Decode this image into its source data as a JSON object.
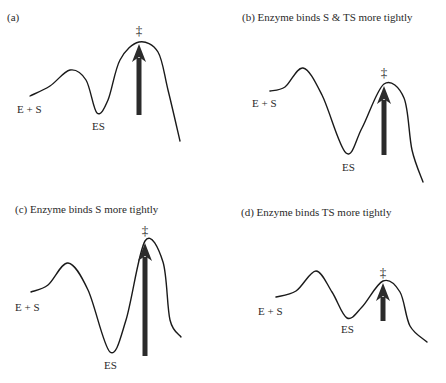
{
  "figure": {
    "panels": [
      {
        "id": "a",
        "title": "(a)",
        "title_pos": [
          7,
          21
        ],
        "curve": [
          [
            30,
            96
          ],
          [
            50,
            86
          ],
          [
            70,
            70
          ],
          [
            86,
            80
          ],
          [
            97,
            113
          ],
          [
            108,
            100
          ],
          [
            120,
            60
          ],
          [
            139,
            42
          ],
          [
            158,
            52
          ],
          [
            168,
            90
          ],
          [
            180,
            141
          ]
        ],
        "arrow": {
          "x": 139,
          "y_bottom": 115,
          "y_top": 44
        },
        "dagger": {
          "symbol": "‡",
          "x": 139,
          "y": 35
        },
        "label_es_plus": {
          "text": "E + S",
          "x": 17,
          "y": 113
        },
        "label_es": {
          "text": "ES",
          "x": 92,
          "y": 130
        }
      },
      {
        "id": "b",
        "title": "(b) Enzyme binds S & TS more tightly",
        "title_pos": [
          242,
          21
        ],
        "curve": [
          [
            270,
            91
          ],
          [
            285,
            87
          ],
          [
            303,
            68
          ],
          [
            322,
            95
          ],
          [
            346,
            153
          ],
          [
            362,
            128
          ],
          [
            384,
            84
          ],
          [
            404,
            98
          ],
          [
            412,
            150
          ],
          [
            423,
            182
          ]
        ],
        "arrow": {
          "x": 384,
          "y_bottom": 155,
          "y_top": 86
        },
        "dagger": {
          "symbol": "‡",
          "x": 384,
          "y": 77
        },
        "label_es_plus": {
          "text": "E + S",
          "x": 252,
          "y": 107
        },
        "label_es": {
          "text": "ES",
          "x": 342,
          "y": 171
        }
      },
      {
        "id": "c",
        "title": "(c) Enzyme binds S more tightly",
        "title_pos": [
          15,
          213
        ],
        "curve": [
          [
            31,
            292
          ],
          [
            48,
            285
          ],
          [
            68,
            263
          ],
          [
            88,
            290
          ],
          [
            110,
            352
          ],
          [
            126,
            320
          ],
          [
            145,
            241
          ],
          [
            163,
            262
          ],
          [
            170,
            320
          ],
          [
            181,
            337
          ]
        ],
        "arrow": {
          "x": 145,
          "y_bottom": 356,
          "y_top": 243
        },
        "dagger": {
          "symbol": "‡",
          "x": 145,
          "y": 235
        },
        "label_es_plus": {
          "text": "E + S",
          "x": 15,
          "y": 311
        },
        "label_es": {
          "text": "ES",
          "x": 104,
          "y": 369
        }
      },
      {
        "id": "d",
        "title": "(d) Enzyme binds TS more tightly",
        "title_pos": [
          241,
          216
        ],
        "curve": [
          [
            276,
            297
          ],
          [
            296,
            291
          ],
          [
            316,
            271
          ],
          [
            332,
            292
          ],
          [
            347,
            318
          ],
          [
            362,
            307
          ],
          [
            383,
            281
          ],
          [
            400,
            292
          ],
          [
            410,
            326
          ],
          [
            427,
            342
          ]
        ],
        "arrow": {
          "x": 383,
          "y_bottom": 321,
          "y_top": 283
        },
        "dagger": {
          "symbol": "‡",
          "x": 383,
          "y": 277
        },
        "label_es_plus": {
          "text": "E + S",
          "x": 258,
          "y": 315
        },
        "label_es": {
          "text": "ES",
          "x": 341,
          "y": 333
        }
      }
    ]
  }
}
